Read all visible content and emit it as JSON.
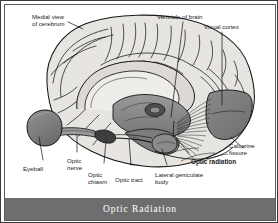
{
  "figure": {
    "caption": "Optic Radiation",
    "caption_bar_color": "#6e6e6e",
    "caption_text_color": "#ffffff",
    "border_color": "#3a3a3a",
    "background_color": "#ffffff"
  },
  "illustration": {
    "subject": "medial view of human cerebrum showing the visual pathway",
    "type": "anatomical-line-drawing",
    "brain_fill": "#e8e6e3",
    "brain_outline": "#1a1a1a",
    "shaded_structure_fill": "#8c8c8c",
    "deep_structure_fill": "#6b6b6b"
  },
  "annotations": [
    {
      "id": "medial-view-of-cerebrum",
      "label": "Medial view\nof cerebrum",
      "bold": false
    },
    {
      "id": "ventricle-of-brain",
      "label": "Ventricle of brain",
      "bold": false
    },
    {
      "id": "visual-cortex",
      "label": "Visual cortex",
      "bold": false
    },
    {
      "id": "calcarine-fissure",
      "label": "Calcarine\nfissure",
      "bold": false
    },
    {
      "id": "optic-radiation",
      "label": "Optic radiation",
      "bold": true
    },
    {
      "id": "lateral-geniculate-body",
      "label": "Lateral geniculate\nbody",
      "bold": false
    },
    {
      "id": "optic-tract",
      "label": "Optic tract",
      "bold": false
    },
    {
      "id": "optic-chiasm",
      "label": "Optic\nchiasm",
      "bold": false
    },
    {
      "id": "optic-nerve",
      "label": "Optic\nnerve",
      "bold": false
    },
    {
      "id": "eyeball",
      "label": "Eyeball",
      "bold": false
    }
  ]
}
